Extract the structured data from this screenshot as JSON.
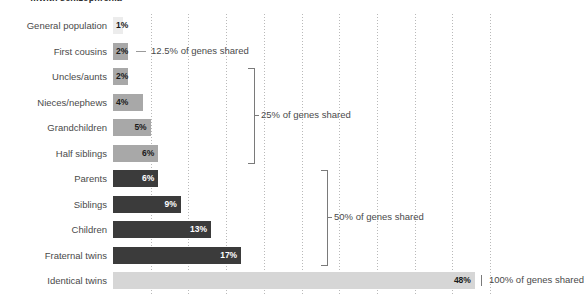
{
  "title": "…with schizophrenia",
  "chart_data": {
    "type": "bar",
    "orientation": "horizontal",
    "title": "…with schizophrenia",
    "xlabel": "",
    "ylabel": "",
    "xlim": [
      0,
      50
    ],
    "grid": true,
    "gridline_values": [
      5,
      10,
      15,
      20,
      25,
      30,
      35,
      40,
      45,
      50
    ],
    "legend": "none",
    "categories": [
      "General population",
      "First cousins",
      "Uncles/aunts",
      "Nieces/nephews",
      "Grandchildren",
      "Half siblings",
      "Parents",
      "Siblings",
      "Children",
      "Fraternal twins",
      "Identical twins"
    ],
    "values": [
      1,
      2,
      2,
      4,
      5,
      6,
      6,
      9,
      13,
      17,
      48
    ],
    "value_labels": [
      "1%",
      "2%",
      "2%",
      "4%",
      "5%",
      "6%",
      "6%",
      "9%",
      "13%",
      "17%",
      "48%"
    ],
    "bar_tones": [
      "faint",
      "mid",
      "mid",
      "mid",
      "mid",
      "mid",
      "dark",
      "dark",
      "dark",
      "dark",
      "light"
    ],
    "annotations": [
      {
        "label": "12.5% of genes shared",
        "rows": [
          1
        ],
        "style": "dash"
      },
      {
        "label": "25% of genes shared",
        "rows": [
          2,
          3,
          4,
          5
        ],
        "style": "bracket"
      },
      {
        "label": "50% of genes shared",
        "rows": [
          6,
          7,
          8,
          9
        ],
        "style": "bracket"
      },
      {
        "label": "100% of genes shared",
        "rows": [
          10
        ],
        "style": "tick"
      }
    ]
  },
  "colors": {
    "bar_faint": "#ececec",
    "bar_light": "#d6d6d6",
    "bar_mid": "#a8a8a8",
    "bar_dark": "#3b3b3b",
    "gridline": "#b9b9b9",
    "label_text": "#4a4a4a",
    "annotation_rule": "#7a7a7a",
    "background": "#ffffff"
  }
}
